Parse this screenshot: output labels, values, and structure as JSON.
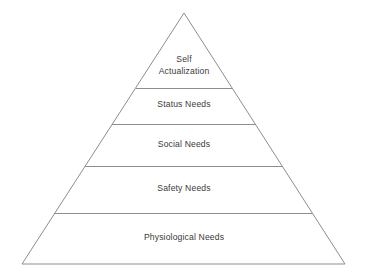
{
  "diagram": {
    "type": "pyramid",
    "name": "hierarchy-of-needs-pyramid",
    "background_color": "#ffffff",
    "stroke_color": "#8d8d8d",
    "text_color": "#3b3b3b",
    "apex": {
      "x": 184,
      "y": 13
    },
    "base_left": {
      "x": 22,
      "y": 264
    },
    "base_right": {
      "x": 345,
      "y": 264
    },
    "divider_y": [
      88,
      124,
      166,
      213
    ],
    "tiers": [
      {
        "id": "self-actualization",
        "level": 1,
        "label": "Self Actualization",
        "lines": [
          "Self",
          "Actualization"
        ]
      },
      {
        "id": "status-needs",
        "level": 2,
        "label": "Status Needs",
        "lines": [
          "Status Needs"
        ]
      },
      {
        "id": "social-needs",
        "level": 3,
        "label": "Social Needs",
        "lines": [
          "Social Needs"
        ]
      },
      {
        "id": "safety-needs",
        "level": 4,
        "label": "Safety Needs",
        "lines": [
          "Safety Needs"
        ]
      },
      {
        "id": "physiological-needs",
        "level": 5,
        "label": "Physiological Needs",
        "lines": [
          "Physiological Needs"
        ]
      }
    ]
  }
}
